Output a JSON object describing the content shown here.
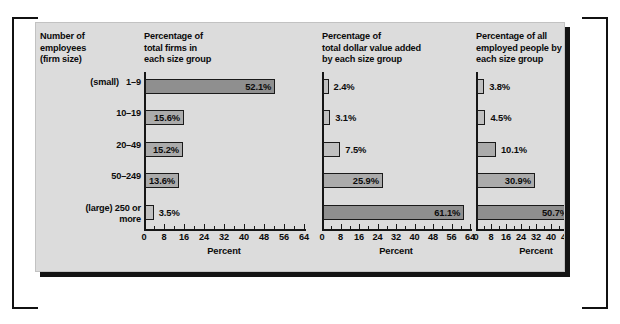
{
  "figure": {
    "background_color": "#dcdcdc",
    "frame_color": "#111111"
  },
  "row_label_column": {
    "header": "Number of\nemployees\n(firm size)",
    "header_lines": [
      "Number of",
      "employees",
      "(firm size)"
    ],
    "rows": [
      {
        "size_note": "(small)",
        "range": "1–9",
        "full": "(small)   1–9"
      },
      {
        "size_note": "",
        "range": "10–19",
        "full": "10–19"
      },
      {
        "size_note": "",
        "range": "20–49",
        "full": "20–49"
      },
      {
        "size_note": "",
        "range": "50–249",
        "full": "50–249"
      },
      {
        "size_note": "(large)",
        "range": "250 or more",
        "full": "(large) 250 or\nmore"
      }
    ]
  },
  "chart_data": [
    {
      "type": "bar",
      "title": "Percentage of\ntotal firms in\neach size group",
      "title_lines": [
        "Percentage of",
        "total firms in",
        "each size group"
      ],
      "orientation": "horizontal",
      "categories": [
        "1–9",
        "10–19",
        "20–49",
        "50–249",
        "250 or more"
      ],
      "values": [
        52.1,
        15.6,
        15.2,
        13.6,
        3.5
      ],
      "labels": [
        "52.1%",
        "15.6%",
        "15.2%",
        "13.6%",
        "3.5%"
      ],
      "label_placement": [
        "inside",
        "inside",
        "inside",
        "inside",
        "outside"
      ],
      "shade": [
        "dark",
        "medium",
        "medium",
        "medium",
        "light"
      ],
      "xlabel": "Percent",
      "ylabel": "",
      "xlim": [
        0,
        64
      ],
      "xticks": [
        0,
        8,
        16,
        24,
        32,
        40,
        48,
        56,
        64
      ],
      "xtick_labels": [
        "0",
        "8",
        "16",
        "24",
        "32",
        "40",
        "48",
        "56",
        "64"
      ],
      "minor_tick_interval": 4,
      "grid": false,
      "legend": "none"
    },
    {
      "type": "bar",
      "title": "Percentage of\ntotal dollar value added\nby each size group",
      "title_lines": [
        "Percentage of",
        "total dollar value added",
        "by each size group"
      ],
      "orientation": "horizontal",
      "categories": [
        "1–9",
        "10–19",
        "20–49",
        "50–249",
        "250 or more"
      ],
      "values": [
        2.4,
        3.1,
        7.5,
        25.9,
        61.1
      ],
      "labels": [
        "2.4%",
        "3.1%",
        "7.5%",
        "25.9%",
        "61.1%"
      ],
      "label_placement": [
        "outside",
        "outside",
        "outside",
        "inside",
        "inside"
      ],
      "shade": [
        "light",
        "light",
        "light",
        "medium",
        "dark"
      ],
      "xlabel": "Percent",
      "ylabel": "",
      "xlim": [
        0,
        64
      ],
      "xticks": [
        0,
        8,
        16,
        24,
        32,
        40,
        48,
        56,
        64
      ],
      "xtick_labels": [
        "0",
        "8",
        "16",
        "24",
        "32",
        "40",
        "48",
        "56",
        "64"
      ],
      "minor_tick_interval": 4,
      "grid": false,
      "legend": "none"
    },
    {
      "type": "bar",
      "title": "Percentage of all\nemployed people by\neach size group",
      "title_lines": [
        "Percentage of all",
        "employed people by",
        "each size group"
      ],
      "orientation": "horizontal",
      "categories": [
        "1–9",
        "10–19",
        "20–49",
        "50–249",
        "250 or more"
      ],
      "values": [
        3.8,
        4.5,
        10.1,
        30.9,
        50.7
      ],
      "labels": [
        "3.8%",
        "4.5%",
        "10.1%",
        "30.9%",
        "50.7%"
      ],
      "label_placement": [
        "outside",
        "outside",
        "outside",
        "inside",
        "inside"
      ],
      "shade": [
        "light",
        "light",
        "medium",
        "medium",
        "dark"
      ],
      "xlabel": "Percent",
      "ylabel": "",
      "xlim": [
        0,
        64
      ],
      "xticks": [
        0,
        8,
        16,
        24,
        32,
        40,
        48,
        56,
        64
      ],
      "xtick_labels": [
        "0",
        "8",
        "16",
        "24",
        "32",
        "40",
        "48",
        "56",
        "64"
      ],
      "minor_tick_interval": 4,
      "grid": false,
      "legend": "none"
    }
  ]
}
